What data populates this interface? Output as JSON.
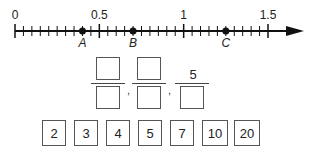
{
  "number_line": {
    "min": 0,
    "max": 1.5,
    "tick_step": 0.05,
    "labels": [
      {
        "value": 0,
        "text": "0"
      },
      {
        "value": 0.5,
        "text": "0.5"
      },
      {
        "value": 1,
        "text": "1"
      },
      {
        "value": 1.5,
        "text": "1.5"
      }
    ],
    "points": [
      {
        "name": "A",
        "value": 0.4
      },
      {
        "name": "B",
        "value": 0.7
      },
      {
        "name": "C",
        "value": 1.25
      }
    ]
  },
  "fractions": [
    {
      "numerator": "",
      "denominator": ""
    },
    {
      "numerator": "",
      "denominator": ""
    },
    {
      "numerator": "5",
      "denominator": ""
    }
  ],
  "separator": ",",
  "tiles": [
    "2",
    "3",
    "4",
    "5",
    "7",
    "10",
    "20"
  ],
  "colors": {
    "line": "#111111",
    "box_border": "#555555"
  }
}
